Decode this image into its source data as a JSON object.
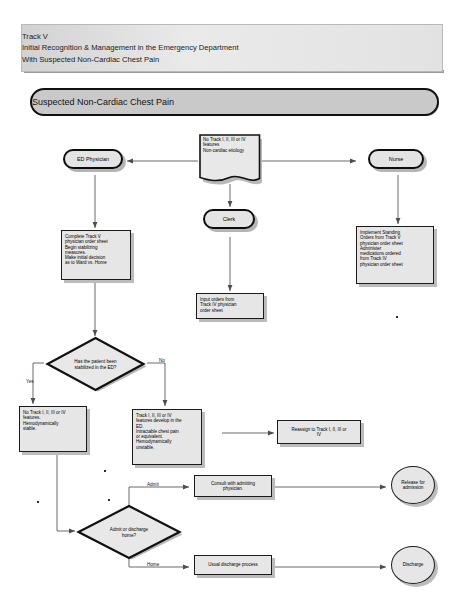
{
  "document": {
    "title_lines": "Track V\nInitial Recognition & Management in the Emergency Department\nWith Suspected Non-Cardiac Chest Pain",
    "start_label": "Suspected Non-Cardiac Chest Pain"
  },
  "colors": {
    "node_fill": "#e6e6e6",
    "node_border": "#1b1b1b",
    "banner_fill": "#dcdcdc",
    "start_fill": "#c9c9c9",
    "shadow": "#bcbcbc",
    "connector": "#5a5a5a",
    "text": "#111111"
  },
  "nodes": {
    "trigger_doc": "No Track I, II, III or IV features\nNon-cardiac etiology",
    "ed_physician": "ED Physician",
    "nurse": "Nurse",
    "clerk": "Clerk",
    "physician_actions": "Complete Track V\nphysician order sheet\nBegin stabilizing\nmeasures.\nMake initial decision\nas to Ward vs. Home",
    "nurse_actions": "Implement Standing\nOrders from Track V\nphysician order sheet\nAdminister\nmedications ordered\nfrom Track IV\nphysician order sheet",
    "clerk_actions": "Input orders from\nTrack IV physician\norder sheet",
    "stabilized_decision": "Has the patient been\nstabilized in the ED?",
    "stable_outcome": "No Track I, II, III or IV\nfeatures.\nHemodynamically\nstable.",
    "unstable_outcome": "Track I, II, III or IV\nfeatures develop in the\nED.\nIntractable chest pain\nor equivalent.\nHemodynamically\nunstable.",
    "reassign": "Reassign to Track I, II, III or\nIV",
    "admit_decision": "Admit or discharge\nhome?",
    "consult": "Consult with admitting\nphysician.",
    "release_admission": "Release for\nadmission",
    "discharge_process": "Usual discharge process",
    "discharge": "Discharge"
  },
  "edge_labels": {
    "yes": "Yes",
    "no": "No",
    "admit": "Admit",
    "home": "Home"
  }
}
